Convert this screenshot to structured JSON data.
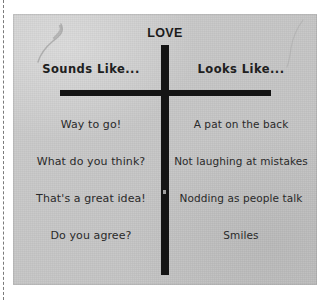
{
  "worksheet": {
    "title": "LOVE",
    "columns": [
      {
        "header": "Sounds Like...",
        "entries": [
          "Way to go!",
          "What do you think?",
          "That's a great idea!",
          "Do you agree?"
        ]
      },
      {
        "header": "Looks Like...",
        "entries": [
          "A pat on the back",
          "Not laughing at mistakes",
          "Nodding as people talk",
          "Smiles"
        ]
      }
    ]
  },
  "colors": {
    "page": "#c9c9c9",
    "ink": "#141414",
    "text": "#2a2a2a"
  }
}
